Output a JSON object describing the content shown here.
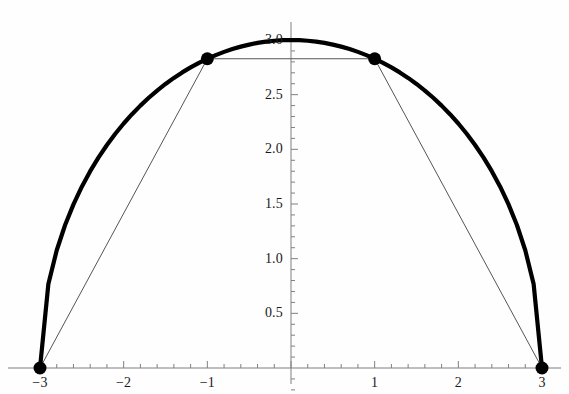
{
  "chart_data": {
    "type": "line",
    "title": "",
    "subtitle": "",
    "xlabel": "",
    "ylabel": "",
    "xlim": [
      -3.25,
      3.25
    ],
    "ylim": [
      0,
      3.15
    ],
    "grid": false,
    "legend": null,
    "background_color": "#fefefe",
    "axis_color": "#808080",
    "curve_color": "#000000",
    "chord_color": "#555555",
    "marker_color": "#000000",
    "x_ticks": [
      {
        "value": -3,
        "label": "−3"
      },
      {
        "value": -2,
        "label": "−2"
      },
      {
        "value": -1,
        "label": "−1"
      },
      {
        "value": 0,
        "label": ""
      },
      {
        "value": 1,
        "label": "1"
      },
      {
        "value": 2,
        "label": "2"
      },
      {
        "value": 3,
        "label": "3"
      }
    ],
    "y_ticks": [
      {
        "value": 0.5,
        "label": "0.5"
      },
      {
        "value": 1.0,
        "label": "1.0"
      },
      {
        "value": 1.5,
        "label": "1.5"
      },
      {
        "value": 2.0,
        "label": "2.0"
      },
      {
        "value": 2.5,
        "label": "2.5"
      },
      {
        "value": 3.0,
        "label": "3.0"
      }
    ],
    "x_minor_ticks_per_interval": 4,
    "y_minor_ticks_per_interval": 4,
    "series": [
      {
        "name": "semicircle",
        "type": "line",
        "style": "thick",
        "formula": "y = sqrt(9 - x^2)",
        "radius": 3,
        "x": [
          -3,
          -2.9,
          -2.8,
          -2.7,
          -2.6,
          -2.5,
          -2.4,
          -2.3,
          -2.2,
          -2.1,
          -2,
          -1.9,
          -1.8,
          -1.7,
          -1.6,
          -1.5,
          -1.4,
          -1.3,
          -1.2,
          -1.1,
          -1,
          -0.9,
          -0.8,
          -0.7,
          -0.6,
          -0.5,
          -0.4,
          -0.3,
          -0.2,
          -0.1,
          0,
          0.1,
          0.2,
          0.3,
          0.4,
          0.5,
          0.6,
          0.7,
          0.8,
          0.9,
          1,
          1.1,
          1.2,
          1.3,
          1.4,
          1.5,
          1.6,
          1.7,
          1.8,
          1.9,
          2,
          2.1,
          2.2,
          2.3,
          2.4,
          2.5,
          2.6,
          2.7,
          2.8,
          2.9,
          3
        ],
        "y": [
          0,
          0.7681,
          1.077,
          1.3077,
          1.4967,
          1.6583,
          1.8,
          1.9261,
          2.0396,
          2.1424,
          2.2361,
          2.3216,
          2.4,
          2.4718,
          2.5377,
          2.5981,
          2.6533,
          2.7037,
          2.7495,
          2.7911,
          2.8284,
          2.8618,
          2.8914,
          2.9172,
          2.9394,
          2.958,
          2.9732,
          2.985,
          2.9933,
          2.9983,
          3.0,
          2.9983,
          2.9933,
          2.985,
          2.9732,
          2.958,
          2.9394,
          2.9172,
          2.8914,
          2.8618,
          2.8284,
          2.7911,
          2.7495,
          2.7037,
          2.6533,
          2.5981,
          2.5377,
          2.4718,
          2.4,
          2.3216,
          2.2361,
          2.1424,
          2.0396,
          1.9261,
          1.8,
          1.6583,
          1.4967,
          1.3077,
          1.077,
          0.7681,
          0
        ]
      },
      {
        "name": "inscribed-polyline",
        "type": "line",
        "style": "thin",
        "x": [
          -3,
          -1,
          1,
          3
        ],
        "y": [
          0,
          2.8284,
          2.8284,
          0
        ]
      }
    ],
    "points": [
      {
        "x": -3,
        "y": 0,
        "label": "(-3, 0)"
      },
      {
        "x": -1,
        "y": 2.8284,
        "label": "(-1, 2.83)"
      },
      {
        "x": 1,
        "y": 2.8284,
        "label": "(1, 2.83)"
      },
      {
        "x": 3,
        "y": 0,
        "label": "(3, 0)"
      }
    ],
    "annotations": []
  }
}
